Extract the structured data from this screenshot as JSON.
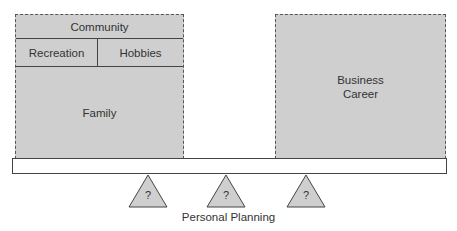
{
  "diagram": {
    "left_box": {
      "community": "Community",
      "recreation": "Recreation",
      "hobbies": "Hobbies",
      "family": "Family"
    },
    "right_box": {
      "line1": "Business",
      "line2": "Career"
    },
    "fulcrums": [
      "?",
      "?",
      "?"
    ],
    "caption": "Personal Planning"
  }
}
